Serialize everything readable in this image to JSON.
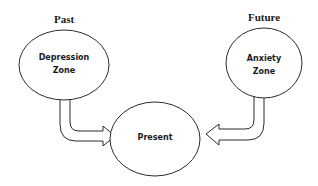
{
  "diagram": {
    "labels": {
      "past": "Past",
      "future": "Future"
    },
    "nodes": {
      "depression": {
        "line1": "Depression",
        "line2": "Zone"
      },
      "anxiety": {
        "line1": "Anxiety",
        "line2": "Zone"
      },
      "present": {
        "label": "Present"
      }
    },
    "edges": [
      {
        "from": "Depression Zone",
        "to": "Present",
        "style": "hollow-bent-arrow"
      },
      {
        "from": "Anxiety Zone",
        "to": "Present",
        "style": "hollow-bent-arrow"
      }
    ],
    "colors": {
      "stroke": "#2a2a2a",
      "fill": "#ffffff",
      "text": "#1a1a1a"
    }
  }
}
